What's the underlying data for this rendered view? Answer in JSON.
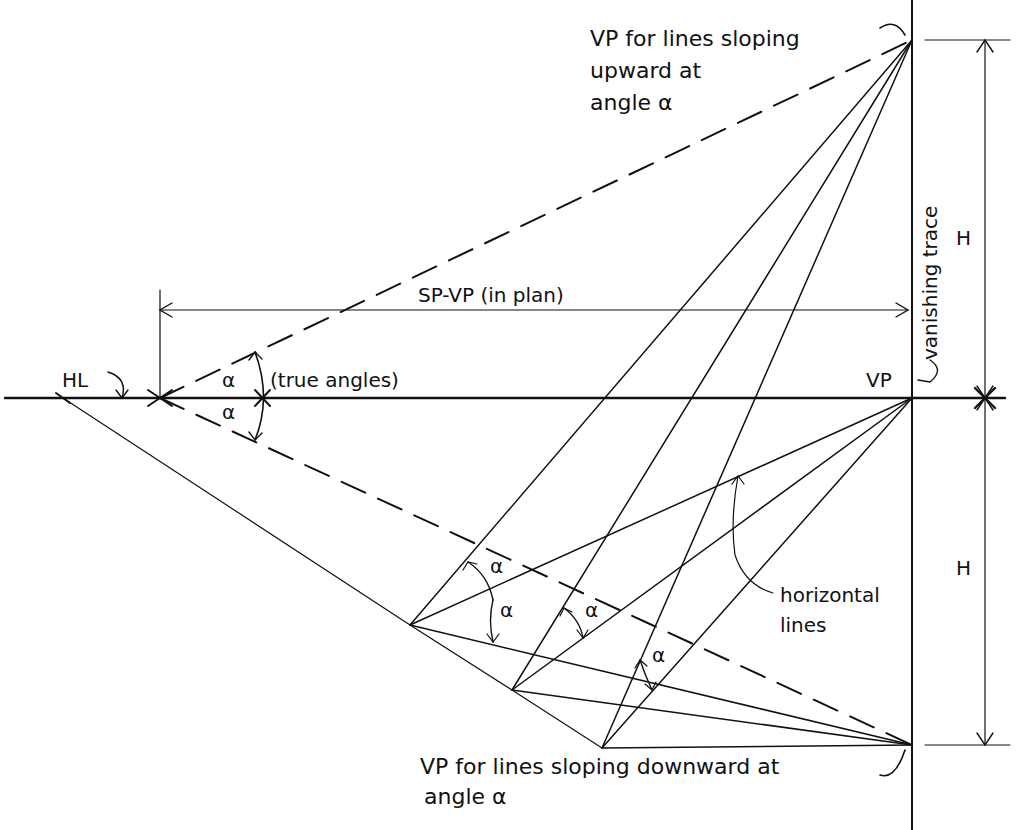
{
  "diagram": {
    "colors": {
      "ink": "#111111",
      "background": "#ffffff"
    },
    "labels": {
      "vp_up": [
        "VP for lines sloping",
        "upward at",
        "angle α"
      ],
      "vanishing_trace": "vanishing trace",
      "H_upper": "H",
      "H_lower": "H",
      "sp_vp": "SP-VP  (in plan)",
      "HL": "HL",
      "alpha_upper": "α",
      "alpha_lower": "α",
      "true_angles": "(true angles)",
      "VP": "VP",
      "alpha_1": "α",
      "alpha_2": "α",
      "alpha_3": "α",
      "alpha_4": "α",
      "horizontal_lines": [
        "horizontal",
        "lines"
      ],
      "vp_down": [
        "VP for lines sloping downward at",
        "angle α"
      ]
    },
    "points": {
      "VP_up": [
        912,
        40
      ],
      "VP": [
        912,
        398
      ],
      "VP_down": [
        912,
        745
      ],
      "SP": [
        160,
        398
      ],
      "HL_left": [
        63,
        398
      ],
      "P1": [
        410,
        625
      ],
      "P2": [
        512,
        690
      ],
      "P3": [
        602,
        748
      ]
    }
  }
}
